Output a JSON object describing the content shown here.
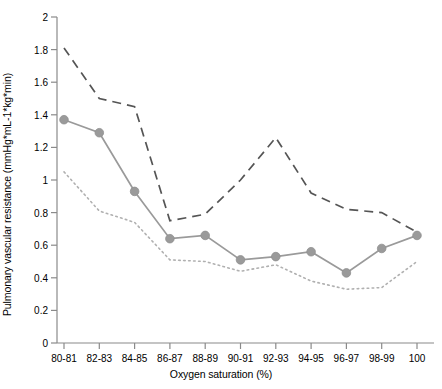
{
  "chart_data": {
    "type": "line",
    "title": "",
    "xlabel": "Oxygen saturation (%)",
    "ylabel": "Pulmonary vascular resistance (mmHg*mL-1*kg*min)",
    "categories": [
      "80-81",
      "82-83",
      "84-85",
      "86-87",
      "88-89",
      "90-91",
      "92-93",
      "94-95",
      "96-97",
      "98-99",
      "100"
    ],
    "ylim": [
      0,
      2
    ],
    "yticks": [
      0,
      0.2,
      0.4,
      0.6,
      0.8,
      1,
      1.2,
      1.4,
      1.6,
      1.8,
      2
    ],
    "ytick_labels": [
      "0",
      "0.2",
      "0.4",
      "0.6",
      "0.8",
      "1",
      "1.2",
      "1.4",
      "1.6",
      "1.8",
      "2"
    ],
    "grid": false,
    "legend": "none",
    "series": [
      {
        "name": "upper-confidence-limit",
        "style": "dashed",
        "color": "#555555",
        "markers": false,
        "values": [
          1.81,
          1.5,
          1.45,
          0.75,
          0.79,
          1.0,
          1.26,
          0.92,
          0.82,
          0.8,
          0.68
        ]
      },
      {
        "name": "mean",
        "style": "solid",
        "color": "#9a9a9a",
        "markers": true,
        "values": [
          1.37,
          1.29,
          0.93,
          0.64,
          0.66,
          0.51,
          0.53,
          0.56,
          0.43,
          0.58,
          0.66
        ]
      },
      {
        "name": "lower-confidence-limit",
        "style": "dotted",
        "color": "#b0b0b0",
        "markers": false,
        "values": [
          1.05,
          0.81,
          0.74,
          0.51,
          0.5,
          0.44,
          0.48,
          0.38,
          0.33,
          0.34,
          0.5
        ]
      }
    ]
  },
  "colors": {
    "axis": "#8a8a8a",
    "marker": "#9a9a9a",
    "upper_line": "#555555",
    "mean_line": "#9a9a9a",
    "lower_line": "#b0b0b0",
    "text": "#000000",
    "background": "#ffffff"
  }
}
